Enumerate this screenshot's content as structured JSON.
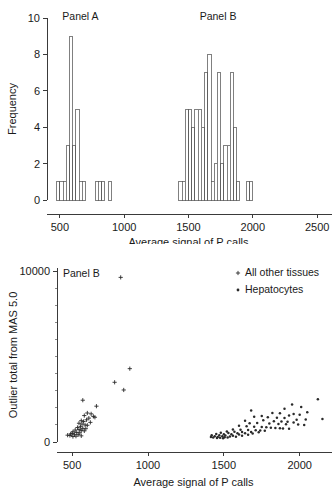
{
  "figure": {
    "title": "",
    "panels": [
      "hist",
      "scatter"
    ]
  },
  "chart_data": [
    {
      "type": "bar",
      "id": "upper-histogram",
      "title": "",
      "xlabel": "Average signal of P calls",
      "ylabel": "Frequency",
      "xlim": [
        400,
        2600
      ],
      "ylim": [
        0,
        10
      ],
      "xticks": [
        500,
        1000,
        1500,
        2000,
        2500
      ],
      "yticks": [
        0,
        2,
        4,
        6,
        8,
        10
      ],
      "grid": false,
      "bin_width": 25,
      "annotations": [
        {
          "text": "Panel A",
          "x": 660,
          "y": 9.9
        },
        {
          "text": "Panel B",
          "x": 1730,
          "y": 9.9
        }
      ],
      "groups": [
        {
          "name": "Panel A",
          "bins": [
            {
              "x": 475,
              "value": 1
            },
            {
              "x": 500,
              "value": 1
            },
            {
              "x": 525,
              "value": 1
            },
            {
              "x": 550,
              "value": 3
            },
            {
              "x": 575,
              "value": 9
            },
            {
              "x": 600,
              "value": 3
            },
            {
              "x": 625,
              "value": 5
            },
            {
              "x": 650,
              "value": 1
            },
            {
              "x": 675,
              "value": 1
            },
            {
              "x": 775,
              "value": 1
            },
            {
              "x": 800,
              "value": 1
            },
            {
              "x": 825,
              "value": 1
            },
            {
              "x": 875,
              "value": 1
            }
          ]
        },
        {
          "name": "Panel B",
          "bins": [
            {
              "x": 1425,
              "value": 1
            },
            {
              "x": 1450,
              "value": 1
            },
            {
              "x": 1475,
              "value": 5
            },
            {
              "x": 1500,
              "value": 5
            },
            {
              "x": 1525,
              "value": 4
            },
            {
              "x": 1550,
              "value": 5
            },
            {
              "x": 1575,
              "value": 5
            },
            {
              "x": 1600,
              "value": 4
            },
            {
              "x": 1625,
              "value": 7
            },
            {
              "x": 1650,
              "value": 8
            },
            {
              "x": 1675,
              "value": 1
            },
            {
              "x": 1700,
              "value": 2
            },
            {
              "x": 1725,
              "value": 7
            },
            {
              "x": 1750,
              "value": 2
            },
            {
              "x": 1775,
              "value": 3
            },
            {
              "x": 1800,
              "value": 3
            },
            {
              "x": 1825,
              "value": 7
            },
            {
              "x": 1850,
              "value": 4
            },
            {
              "x": 1875,
              "value": 1
            },
            {
              "x": 1950,
              "value": 1
            },
            {
              "x": 1975,
              "value": 1
            }
          ]
        }
      ]
    },
    {
      "type": "scatter",
      "id": "lower-scatter",
      "title": "",
      "xlabel": "Average signal of P calls",
      "ylabel": "Outlier total from MAS 5.0",
      "xlim": [
        400,
        2200
      ],
      "ylim": [
        0,
        10200
      ],
      "xticks": [
        500,
        1000,
        1500,
        2000
      ],
      "yticks": [
        0,
        10000
      ],
      "yminor": [
        1000,
        2000,
        3000,
        4000,
        5000,
        6000,
        7000,
        8000,
        9000
      ],
      "grid": false,
      "annotations": [
        {
          "text": "Panel B",
          "x": 560,
          "y": 9700
        }
      ],
      "legend": {
        "position": "top-right",
        "entries": [
          {
            "label": "All other tissues",
            "marker": "plus"
          },
          {
            "label": "Hepatocytes",
            "marker": "dot"
          }
        ]
      },
      "series": [
        {
          "name": "All other tissues",
          "marker": "plus",
          "points": [
            [
              820,
              9650
            ],
            [
              880,
              4300
            ],
            [
              780,
              3500
            ],
            [
              840,
              3050
            ],
            [
              570,
              2450
            ],
            [
              660,
              2100
            ],
            [
              600,
              1700
            ],
            [
              625,
              1650
            ],
            [
              580,
              1550
            ],
            [
              640,
              1500
            ],
            [
              650,
              1450
            ],
            [
              610,
              1400
            ],
            [
              595,
              1300
            ],
            [
              560,
              1250
            ],
            [
              575,
              1200
            ],
            [
              620,
              1150
            ],
            [
              545,
              1100
            ],
            [
              565,
              1050
            ],
            [
              585,
              1000
            ],
            [
              600,
              980
            ],
            [
              555,
              900
            ],
            [
              535,
              850
            ],
            [
              570,
              800
            ],
            [
              590,
              780
            ],
            [
              545,
              730
            ],
            [
              520,
              700
            ],
            [
              560,
              680
            ],
            [
              580,
              650
            ],
            [
              505,
              600
            ],
            [
              530,
              560
            ],
            [
              550,
              540
            ],
            [
              500,
              500
            ],
            [
              490,
              470
            ],
            [
              515,
              450
            ],
            [
              540,
              430
            ],
            [
              470,
              400
            ],
            [
              485,
              380
            ],
            [
              560,
              360
            ],
            [
              525,
              340
            ],
            [
              505,
              320
            ]
          ]
        },
        {
          "name": "Hepatocytes",
          "marker": "dot",
          "points": [
            [
              2120,
              2500
            ],
            [
              1950,
              2200
            ],
            [
              2010,
              2050
            ],
            [
              1900,
              1950
            ],
            [
              1680,
              1850
            ],
            [
              2050,
              1750
            ],
            [
              1820,
              1700
            ],
            [
              1870,
              1680
            ],
            [
              1960,
              1640
            ],
            [
              2000,
              1600
            ],
            [
              1930,
              1560
            ],
            [
              1750,
              1520
            ],
            [
              1700,
              1480
            ],
            [
              1790,
              1450
            ],
            [
              1850,
              1420
            ],
            [
              1900,
              1400
            ],
            [
              2150,
              1350
            ],
            [
              2040,
              1320
            ],
            [
              1980,
              1300
            ],
            [
              1760,
              1280
            ],
            [
              1640,
              1250
            ],
            [
              1830,
              1220
            ],
            [
              1880,
              1200
            ],
            [
              1920,
              1180
            ],
            [
              1960,
              1150
            ],
            [
              1720,
              1120
            ],
            [
              1670,
              1100
            ],
            [
              1800,
              1080
            ],
            [
              1860,
              1060
            ],
            [
              1910,
              1040
            ],
            [
              1990,
              1020
            ],
            [
              2030,
              1000
            ],
            [
              1600,
              950
            ],
            [
              1650,
              930
            ],
            [
              1700,
              900
            ],
            [
              1750,
              880
            ],
            [
              1780,
              860
            ],
            [
              1810,
              840
            ],
            [
              1840,
              820
            ],
            [
              1870,
              800
            ],
            [
              1890,
              790
            ],
            [
              1930,
              770
            ],
            [
              1560,
              740
            ],
            [
              1610,
              720
            ],
            [
              1660,
              700
            ],
            [
              1710,
              690
            ],
            [
              1740,
              670
            ],
            [
              1770,
              660
            ],
            [
              1520,
              620
            ],
            [
              1570,
              600
            ],
            [
              1620,
              590
            ],
            [
              1680,
              580
            ],
            [
              1730,
              570
            ],
            [
              1480,
              540
            ],
            [
              1530,
              530
            ],
            [
              1590,
              520
            ],
            [
              1640,
              510
            ],
            [
              1690,
              500
            ],
            [
              1450,
              470
            ],
            [
              1500,
              460
            ],
            [
              1550,
              450
            ],
            [
              1600,
              440
            ],
            [
              1660,
              430
            ],
            [
              1420,
              400
            ],
            [
              1470,
              390
            ],
            [
              1510,
              380
            ],
            [
              1560,
              370
            ],
            [
              1620,
              360
            ],
            [
              1440,
              340
            ],
            [
              1490,
              330
            ],
            [
              1540,
              320
            ],
            [
              1580,
              310
            ],
            [
              1460,
              290
            ],
            [
              1505,
              280
            ],
            [
              1430,
              260
            ],
            [
              1475,
              250
            ],
            [
              1455,
              230
            ],
            [
              1495,
              220
            ],
            [
              1415,
              300
            ],
            [
              1525,
              260
            ]
          ]
        }
      ]
    }
  ]
}
